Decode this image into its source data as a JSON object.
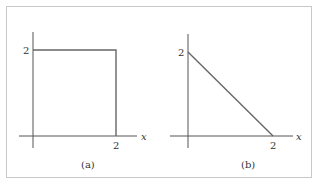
{
  "figure": {
    "panels": [
      {
        "id": "a",
        "caption": "(a)",
        "x_axis_label": "x",
        "x_tick_label": "2",
        "y_tick_label": "2",
        "shape": "square",
        "description": "Square region with corners (0,0), (2,0), (2,2), (0,2)"
      },
      {
        "id": "b",
        "caption": "(b)",
        "x_axis_label": "x",
        "x_tick_label": "2",
        "y_tick_label": "2",
        "shape": "triangle",
        "description": "Line segment from (0,2) to (2,0)"
      }
    ]
  }
}
